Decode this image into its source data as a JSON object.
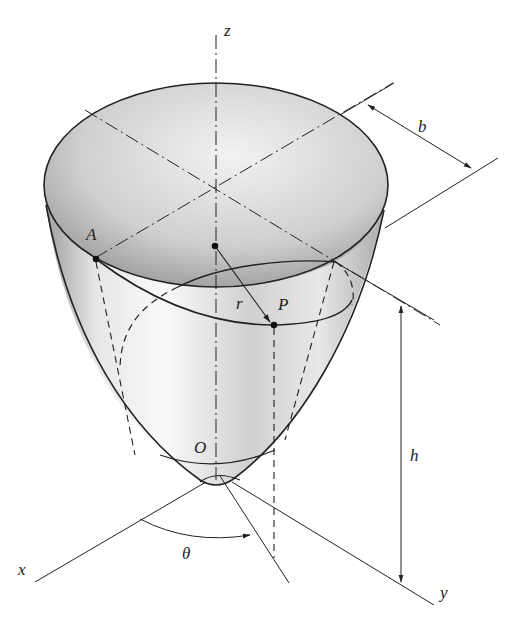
{
  "figure": {
    "labels": {
      "z": "z",
      "x": "x",
      "y": "y",
      "b": "b",
      "h": "h",
      "r": "r",
      "theta": "θ",
      "A": "A",
      "P": "P",
      "O": "O"
    },
    "colors": {
      "line": "#222222",
      "surface_light": "#f4f4f4",
      "surface_dark": "#9a9a9a",
      "background": "#ffffff"
    }
  }
}
